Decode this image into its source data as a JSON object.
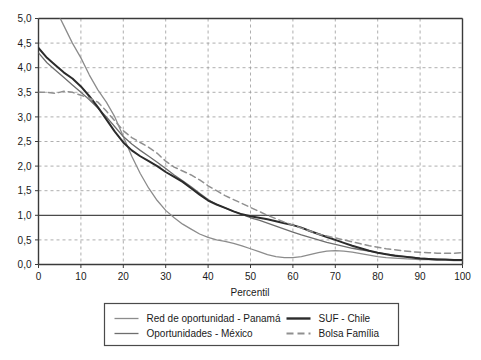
{
  "chart_data": {
    "type": "line",
    "title": "",
    "subtitle": "",
    "xlabel": "Percentil",
    "ylabel": "",
    "xlim": [
      0,
      100
    ],
    "ylim": [
      0,
      5
    ],
    "grid": true,
    "grid_style": "dashed",
    "reference_line": {
      "axis": "y",
      "value": 1.0,
      "style": "solid"
    },
    "legend_position": "bottom",
    "xticks": [
      0,
      10,
      20,
      30,
      40,
      50,
      60,
      70,
      80,
      90,
      100
    ],
    "xtick_labels": [
      "0",
      "10",
      "20",
      "30",
      "40",
      "50",
      "60",
      "70",
      "80",
      "90",
      "100"
    ],
    "yticks": [
      0.0,
      0.5,
      1.0,
      1.5,
      2.0,
      2.5,
      3.0,
      3.5,
      4.0,
      4.5,
      5.0
    ],
    "ytick_labels": [
      "0,0",
      "0,5",
      "1,0",
      "1,5",
      "2,0",
      "2,5",
      "3,0",
      "3,5",
      "4,0",
      "4,5",
      "5,0"
    ],
    "x": [
      0,
      2,
      4,
      6,
      8,
      10,
      12,
      14,
      16,
      18,
      20,
      22,
      24,
      26,
      28,
      30,
      32,
      34,
      36,
      38,
      40,
      42,
      44,
      46,
      48,
      50,
      52,
      54,
      56,
      58,
      60,
      62,
      64,
      66,
      68,
      70,
      72,
      74,
      76,
      78,
      80,
      82,
      84,
      86,
      88,
      90,
      92,
      94,
      96,
      98,
      100
    ],
    "series": [
      {
        "name": "Red de oportunidad - Panamá",
        "color": "#8c8c8c",
        "width": 1.3,
        "dash": "none",
        "values": [
          5.9,
          5.55,
          5.2,
          4.85,
          4.5,
          4.2,
          3.85,
          3.55,
          3.3,
          3.0,
          2.6,
          2.2,
          1.85,
          1.55,
          1.3,
          1.1,
          0.95,
          0.82,
          0.72,
          0.62,
          0.55,
          0.5,
          0.47,
          0.43,
          0.38,
          0.32,
          0.26,
          0.2,
          0.16,
          0.14,
          0.14,
          0.16,
          0.2,
          0.24,
          0.27,
          0.28,
          0.27,
          0.25,
          0.22,
          0.19,
          0.16,
          0.14,
          0.13,
          0.12,
          0.11,
          0.1,
          0.1,
          0.09,
          0.09,
          0.08,
          0.08
        ]
      },
      {
        "name": "Oportunidades - México",
        "color": "#6e6e6e",
        "width": 1.3,
        "dash": "none",
        "values": [
          4.3,
          4.1,
          3.95,
          3.8,
          3.65,
          3.5,
          3.35,
          3.18,
          3.0,
          2.8,
          2.6,
          2.45,
          2.32,
          2.2,
          2.08,
          1.95,
          1.82,
          1.7,
          1.58,
          1.45,
          1.32,
          1.22,
          1.15,
          1.08,
          1.02,
          0.95,
          0.9,
          0.84,
          0.78,
          0.72,
          0.66,
          0.6,
          0.55,
          0.5,
          0.45,
          0.41,
          0.37,
          0.33,
          0.3,
          0.27,
          0.24,
          0.21,
          0.19,
          0.17,
          0.15,
          0.13,
          0.12,
          0.11,
          0.1,
          0.09,
          0.09
        ]
      },
      {
        "name": "SUF - Chile",
        "color": "#2b2b2b",
        "width": 2.0,
        "dash": "none",
        "values": [
          4.4,
          4.2,
          4.05,
          3.9,
          3.78,
          3.62,
          3.42,
          3.2,
          2.95,
          2.7,
          2.48,
          2.32,
          2.2,
          2.1,
          2.0,
          1.88,
          1.78,
          1.68,
          1.55,
          1.42,
          1.3,
          1.22,
          1.15,
          1.08,
          1.02,
          0.98,
          0.95,
          0.92,
          0.88,
          0.84,
          0.8,
          0.75,
          0.68,
          0.62,
          0.56,
          0.5,
          0.44,
          0.38,
          0.33,
          0.28,
          0.24,
          0.21,
          0.18,
          0.16,
          0.14,
          0.12,
          0.11,
          0.1,
          0.1,
          0.09,
          0.09
        ]
      },
      {
        "name": "Bolsa Família",
        "color": "#909090",
        "width": 1.5,
        "dash": "6,4",
        "values": [
          3.5,
          3.5,
          3.48,
          3.52,
          3.5,
          3.44,
          3.38,
          3.3,
          3.12,
          2.92,
          2.72,
          2.58,
          2.48,
          2.38,
          2.26,
          2.1,
          1.98,
          1.9,
          1.82,
          1.72,
          1.6,
          1.5,
          1.4,
          1.32,
          1.24,
          1.16,
          1.08,
          1.0,
          0.93,
          0.86,
          0.8,
          0.74,
          0.68,
          0.62,
          0.58,
          0.54,
          0.5,
          0.46,
          0.42,
          0.38,
          0.35,
          0.32,
          0.3,
          0.28,
          0.26,
          0.25,
          0.24,
          0.23,
          0.23,
          0.23,
          0.24
        ]
      }
    ],
    "legend": [
      {
        "label": "Red de oportunidad - Panamá",
        "color": "#8c8c8c",
        "dash": "none",
        "width": 1.3
      },
      {
        "label": "SUF - Chile",
        "color": "#2b2b2b",
        "dash": "none",
        "width": 2.4
      },
      {
        "label": "Oportunidades - México",
        "color": "#6e6e6e",
        "dash": "none",
        "width": 1.3
      },
      {
        "label": "Bolsa Família",
        "color": "#909090",
        "dash": "6,4",
        "width": 1.8
      }
    ],
    "colors": {
      "axis": "#3a3a3a",
      "grid": "#9a9a9a",
      "reference": "#4a4a4a",
      "legend_border": "#4a4a4a",
      "background": "#ffffff"
    }
  }
}
